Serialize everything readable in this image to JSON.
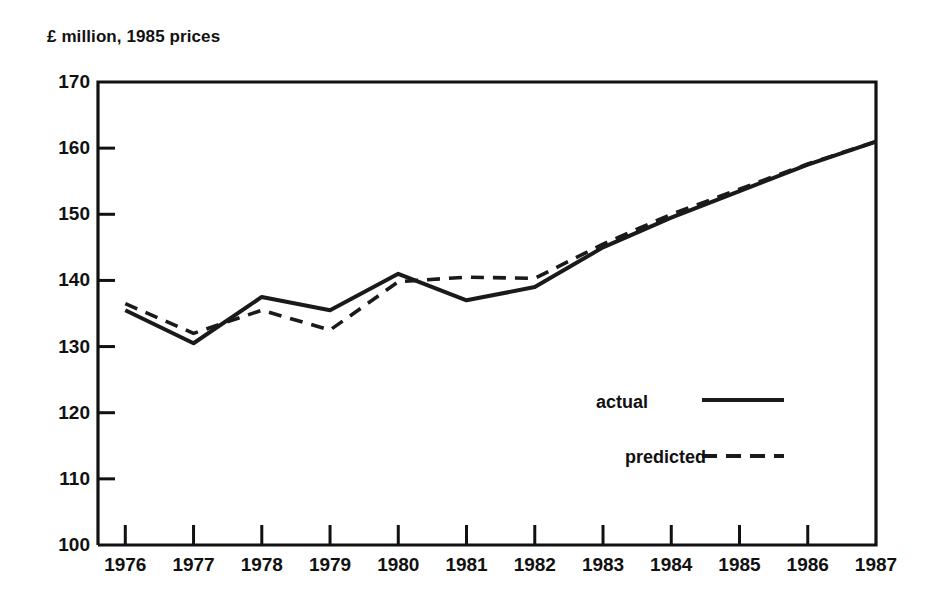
{
  "chart_data": {
    "type": "line",
    "title": "£ million, 1985 prices",
    "xlabel": "",
    "ylabel": "£ million, 1985 prices",
    "x": [
      1976,
      1977,
      1978,
      1979,
      1980,
      1981,
      1982,
      1983,
      1984,
      1985,
      1986,
      1987
    ],
    "categories": [
      "1976",
      "1977",
      "1978",
      "1979",
      "1980",
      "1981",
      "1982",
      "1983",
      "1984",
      "1985",
      "1986",
      "1987"
    ],
    "series": [
      {
        "name": "actual",
        "style": "solid",
        "color": "#1a1a1a",
        "values": [
          135.5,
          130.5,
          137.5,
          135.5,
          141.0,
          137.0,
          139.0,
          145.0,
          149.5,
          153.5,
          157.5,
          161.0
        ]
      },
      {
        "name": "predicted",
        "style": "dashed",
        "color": "#1a1a1a",
        "values": [
          136.5,
          132.0,
          135.5,
          132.5,
          139.8,
          140.5,
          140.3,
          145.5,
          150.0,
          153.8,
          157.6,
          161.0
        ]
      }
    ],
    "ylim": [
      100,
      170
    ],
    "yticks": [
      100,
      110,
      120,
      130,
      140,
      150,
      160,
      170
    ],
    "ytick_labels": [
      "100",
      "110",
      "120",
      "130",
      "140",
      "150",
      "160",
      "170"
    ],
    "xlim": [
      1975.6,
      1987.0
    ],
    "xticks": [
      1976,
      1977,
      1978,
      1979,
      1980,
      1981,
      1982,
      1983,
      1984,
      1985,
      1986,
      1987
    ],
    "xtick_labels": [
      "1976",
      "1977",
      "1978",
      "1979",
      "1980",
      "1981",
      "1982",
      "1983",
      "1984",
      "1985",
      "1986",
      "1987"
    ],
    "grid": false,
    "legend_position": "center-right",
    "legend": [
      {
        "label": "actual",
        "style": "solid"
      },
      {
        "label": "predicted",
        "style": "dashed"
      }
    ]
  },
  "legend": {
    "actual_label": "actual",
    "predicted_label": "predicted"
  },
  "axes": {
    "title": "£ million, 1985 prices"
  },
  "colors": {
    "line": "#1a1a1a",
    "frame": "#111111",
    "background": "#ffffff"
  }
}
